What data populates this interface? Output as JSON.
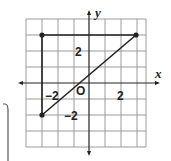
{
  "diagram": {
    "type": "coordinate-plane",
    "axes": {
      "x_label": "x",
      "y_label": "y",
      "origin_label": "O"
    },
    "grid": {
      "x_range": [
        -4,
        3.5
      ],
      "y_range": [
        -4,
        4
      ],
      "step": 1
    },
    "tick_labels": {
      "x_neg": "−2",
      "x_pos": "2",
      "y_pos": "2",
      "y_neg": "−2"
    },
    "points": [
      {
        "x": -3,
        "y": 3
      },
      {
        "x": 3,
        "y": 3
      },
      {
        "x": -3,
        "y": -2
      }
    ],
    "segments": [
      {
        "from": [
          -3,
          3
        ],
        "to": [
          3,
          3
        ]
      },
      {
        "from": [
          -3,
          3
        ],
        "to": [
          -3,
          -2
        ]
      },
      {
        "from": [
          -3,
          -2
        ],
        "to": [
          3,
          3
        ]
      }
    ],
    "colors": {
      "grid": "#9a9a9a",
      "axis": "#222222",
      "figure": "#222222"
    }
  }
}
